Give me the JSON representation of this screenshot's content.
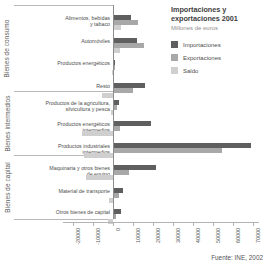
{
  "header": {
    "title": "Importaciones y exportaciones 2001",
    "subtitle": "Millones de euros"
  },
  "legend": {
    "items": [
      {
        "label": "Importaciones",
        "color": "#5f5f5f"
      },
      {
        "label": "Exportaciones",
        "color": "#a8a8a8"
      },
      {
        "label": "Saldo",
        "color": "#cfcfcf"
      }
    ]
  },
  "source": {
    "text": "Fuente: INE, 2002"
  },
  "chart_data": {
    "type": "bar",
    "orientation": "horizontal",
    "title": "Importaciones y exportaciones 2001",
    "subtitle": "Millones de euros",
    "xlabel": "",
    "ylabel": "",
    "xlim": [
      -20000,
      80000
    ],
    "xticks": [
      -20000,
      -10000,
      0,
      10000,
      20000,
      30000,
      40000,
      50000,
      60000,
      70000,
      80000
    ],
    "xtick_labels": [
      "-20000",
      "-10000",
      "0",
      "10000",
      "20000",
      "30000",
      "40000",
      "50000",
      "60000",
      "70000",
      "80000"
    ],
    "grid": false,
    "legend_position": "top-right",
    "groups": [
      {
        "name": "Bienes de consumo",
        "categories": [
          0,
          1,
          2,
          3
        ]
      },
      {
        "name": "Bienes intermedios",
        "categories": [
          4,
          5,
          6
        ]
      },
      {
        "name": "Bienes de capital",
        "categories": [
          7,
          8,
          9
        ]
      }
    ],
    "categories": [
      "Alimentos, bebidas y tabaco",
      "Automóviles",
      "Productos energéticos",
      "Resto",
      "Productos de la agricultura, silvicultura y pesca",
      "Productos energéticos intermedios",
      "Productos industriales intermedios",
      "Maquinaria y otros bienes de equipo",
      "Material de transporte",
      "Otros bienes de capital"
    ],
    "category_label_lines": [
      [
        "Alimentos, bebidas",
        "y tabaco"
      ],
      [
        "Automóviles"
      ],
      [
        "Productos energéticos"
      ],
      [
        "Resto"
      ],
      [
        "Productos de la agricultura,",
        "silvicultura y pesca"
      ],
      [
        "Productos energéticos",
        "intermedios"
      ],
      [
        "Productos industriales",
        "intermedios"
      ],
      [
        "Maquinaria y otros bienes",
        "de equipo"
      ],
      [
        "Material de transporte"
      ],
      [
        "Otros bienes de capital"
      ]
    ],
    "series": [
      {
        "name": "Importaciones",
        "color": "#5f5f5f",
        "values": [
          8300,
          11700,
          600,
          15400,
          2600,
          18500,
          68500,
          21000,
          4500,
          3400
        ]
      },
      {
        "name": "Exportaciones",
        "color": "#a8a8a8",
        "values": [
          11900,
          14900,
          300,
          9700,
          1400,
          3200,
          54000,
          7600,
          2500,
          1100
        ]
      },
      {
        "name": "Saldo",
        "color": "#cfcfcf",
        "values": [
          3600,
          3200,
          -300,
          -5700,
          -1200,
          -15300,
          -14500,
          -13400,
          -2000,
          -2300
        ]
      }
    ]
  }
}
